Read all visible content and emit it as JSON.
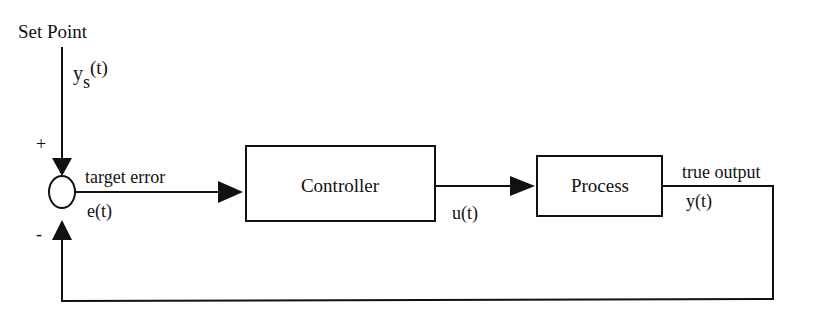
{
  "diagram": {
    "type": "feedback-control-loop",
    "colors": {
      "ink": "#111111",
      "background": "#ffffff"
    },
    "input": {
      "title": "Set Point",
      "signal_base": "y",
      "signal_sub": "s",
      "signal_arg": "(t)"
    },
    "summing_junction": {
      "plus_sign": "+",
      "minus_sign": "-"
    },
    "error_signal": {
      "label": "target error",
      "symbol": "e(t)"
    },
    "blocks": [
      {
        "id": "controller",
        "label": "Controller"
      },
      {
        "id": "process",
        "label": "Process"
      }
    ],
    "control_signal": {
      "symbol": "u(t)"
    },
    "output": {
      "label": "true output",
      "symbol": "y(t)"
    }
  }
}
